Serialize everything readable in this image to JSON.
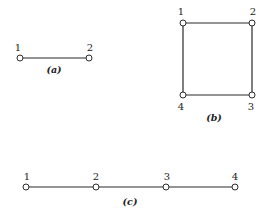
{
  "figures": [
    {
      "id": "a",
      "caption": "(a)",
      "nodes": [
        {
          "label": "1",
          "x": 20,
          "y": 58,
          "lx": 18,
          "ly": 51
        },
        {
          "label": "2",
          "x": 89,
          "y": 58,
          "lx": 90,
          "ly": 51
        }
      ],
      "edges": [
        [
          0,
          1
        ]
      ],
      "caption_pos": {
        "x": 54,
        "y": 73
      }
    },
    {
      "id": "b",
      "caption": "(b)",
      "nodes": [
        {
          "label": "1",
          "x": 183,
          "y": 23,
          "lx": 181,
          "ly": 15
        },
        {
          "label": "2",
          "x": 252,
          "y": 23,
          "lx": 253,
          "ly": 15
        },
        {
          "label": "3",
          "x": 252,
          "y": 95,
          "lx": 251,
          "ly": 110
        },
        {
          "label": "4",
          "x": 183,
          "y": 95,
          "lx": 181,
          "ly": 110
        }
      ],
      "edges": [
        [
          0,
          1
        ],
        [
          1,
          2
        ],
        [
          2,
          3
        ],
        [
          3,
          0
        ]
      ],
      "caption_pos": {
        "x": 214,
        "y": 121
      }
    },
    {
      "id": "c",
      "caption": "(c)",
      "nodes": [
        {
          "label": "1",
          "x": 26,
          "y": 187,
          "lx": 27,
          "ly": 180
        },
        {
          "label": "2",
          "x": 96,
          "y": 187,
          "lx": 96,
          "ly": 180
        },
        {
          "label": "3",
          "x": 166,
          "y": 187,
          "lx": 167,
          "ly": 180
        },
        {
          "label": "4",
          "x": 235,
          "y": 187,
          "lx": 235,
          "ly": 180
        }
      ],
      "edges": [
        [
          0,
          1
        ],
        [
          1,
          2
        ],
        [
          2,
          3
        ]
      ],
      "caption_pos": {
        "x": 130,
        "y": 205
      }
    }
  ]
}
